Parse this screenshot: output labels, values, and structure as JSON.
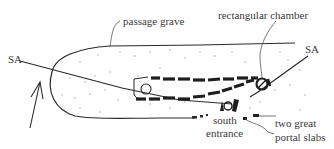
{
  "labels": {
    "passage_grave": "passage grave",
    "rectangular_chamber": "rectangular chamber",
    "sa_left": "SA",
    "sa_right": "SA",
    "south_line1": "south",
    "south_line2": "entrance",
    "portal_line1": "two great",
    "portal_line2": "portal slabs"
  },
  "icons": {
    "north_arrow": "arrow-up-icon"
  },
  "colors": {
    "ink": "#2a2a2a",
    "text": "#3a3a3a",
    "stipple": "#9a9a9a",
    "background": "#ffffff"
  }
}
